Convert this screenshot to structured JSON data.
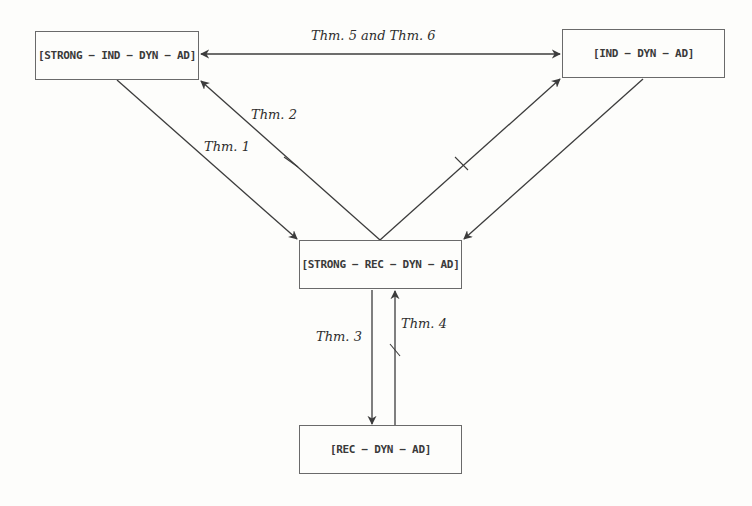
{
  "diagram": {
    "title": "",
    "nodes": [
      {
        "id": "strong-ind-dyn-ad",
        "label": "[STRONG − IND − DYN − AD]",
        "x": 35,
        "y": 31,
        "w": 164,
        "h": 49
      },
      {
        "id": "ind-dyn-ad",
        "label": "[IND − DYN − AD]",
        "x": 562,
        "y": 29,
        "w": 163,
        "h": 49
      },
      {
        "id": "strong-rec-dyn-ad",
        "label": "[STRONG − REC − DYN − AD]",
        "x": 299,
        "y": 240,
        "w": 163,
        "h": 49
      },
      {
        "id": "rec-dyn-ad",
        "label": "[REC − DYN − AD]",
        "x": 299,
        "y": 425,
        "w": 163,
        "h": 49
      }
    ],
    "edges": [
      {
        "from": "strong-ind-dyn-ad",
        "to": "ind-dyn-ad",
        "label": "Thm. 5 and Thm. 6",
        "bidirectional": true,
        "negated": false
      },
      {
        "from": "strong-ind-dyn-ad",
        "to": "strong-rec-dyn-ad",
        "label": "Thm. 1",
        "bidirectional": false,
        "negated": false
      },
      {
        "from": "strong-rec-dyn-ad",
        "to": "strong-ind-dyn-ad",
        "label": "Thm. 2",
        "bidirectional": false,
        "negated": true
      },
      {
        "from": "ind-dyn-ad",
        "to": "strong-rec-dyn-ad",
        "label": "",
        "bidirectional": false,
        "negated": false
      },
      {
        "from": "strong-rec-dyn-ad",
        "to": "ind-dyn-ad",
        "label": "",
        "bidirectional": false,
        "negated": true
      },
      {
        "from": "strong-rec-dyn-ad",
        "to": "rec-dyn-ad",
        "label": "Thm. 3",
        "bidirectional": false,
        "negated": false
      },
      {
        "from": "rec-dyn-ad",
        "to": "strong-rec-dyn-ad",
        "label": "Thm. 4",
        "bidirectional": false,
        "negated": true
      }
    ],
    "labels": {
      "thm56": "Thm. 5 and Thm. 6",
      "thm1": "Thm. 1",
      "thm2": "Thm. 2",
      "thm3": "Thm. 3",
      "thm4": "Thm. 4"
    },
    "colors": {
      "background": "#fdfdfb",
      "line": "#3c3c3c",
      "box_border": "#6a6a6a",
      "text": "#2e2e2e"
    }
  }
}
